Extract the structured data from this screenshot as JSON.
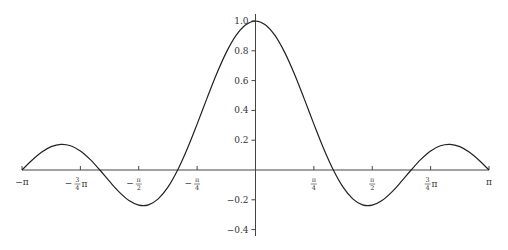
{
  "chart_data": {
    "type": "line",
    "title": "",
    "xlabel": "",
    "ylabel": "",
    "xlim": [
      -3.14159,
      3.14159
    ],
    "ylim": [
      -0.45,
      1.0
    ],
    "grid": false,
    "legend": null,
    "x_ticks": [
      {
        "value": -3.14159,
        "label": "−π",
        "num": "",
        "den": "",
        "suffix": ""
      },
      {
        "value": -2.35619,
        "label": "−¾π",
        "num": "3",
        "den": "4",
        "suffix": "π",
        "sign": "−"
      },
      {
        "value": -1.5708,
        "label": "−π/2",
        "num": "π",
        "den": "2",
        "suffix": "",
        "sign": "−"
      },
      {
        "value": -0.7854,
        "label": "−π/4",
        "num": "π",
        "den": "4",
        "suffix": "",
        "sign": "−"
      },
      {
        "value": 0.7854,
        "label": "π/4",
        "num": "π",
        "den": "4",
        "suffix": "",
        "sign": ""
      },
      {
        "value": 1.5708,
        "label": "π/2",
        "num": "π",
        "den": "2",
        "suffix": "",
        "sign": ""
      },
      {
        "value": 2.35619,
        "label": "¾π",
        "num": "3",
        "den": "4",
        "suffix": "π",
        "sign": ""
      },
      {
        "value": 3.14159,
        "label": "π",
        "num": "",
        "den": "",
        "suffix": ""
      }
    ],
    "y_ticks": [
      {
        "value": 1.0,
        "label": "1.0"
      },
      {
        "value": 0.8,
        "label": "0.8"
      },
      {
        "value": 0.6,
        "label": "0.6"
      },
      {
        "value": 0.4,
        "label": "0.4"
      },
      {
        "value": 0.2,
        "label": "0.2"
      },
      {
        "value": -0.2,
        "label": "-0.2"
      },
      {
        "value": -0.4,
        "label": "-0.4"
      }
    ],
    "series": [
      {
        "name": "f(x)",
        "color": "#222222",
        "x": [
          -3.1416,
          -3.0107,
          -2.8798,
          -2.7489,
          -2.618,
          -2.4871,
          -2.3562,
          -2.2253,
          -2.0944,
          -1.9635,
          -1.8326,
          -1.7017,
          -1.5708,
          -1.4399,
          -1.309,
          -1.1781,
          -1.0472,
          -0.9163,
          -0.7854,
          -0.6545,
          -0.5236,
          -0.3927,
          -0.2618,
          -0.1309,
          0,
          0.1309,
          0.2618,
          0.3927,
          0.5236,
          0.6545,
          0.7854,
          0.9163,
          1.0472,
          1.1781,
          1.309,
          1.4399,
          1.5708,
          1.7017,
          1.8326,
          1.9635,
          2.0944,
          2.2253,
          2.3562,
          2.4871,
          2.618,
          2.7489,
          2.8798,
          3.0107,
          3.1416
        ],
        "values": [
          0,
          0.0639,
          0.1189,
          0.157,
          0.1725,
          0.1626,
          0.1276,
          0.0711,
          0,
          -0.0767,
          -0.1485,
          -0.2048,
          -0.2357,
          -0.2336,
          -0.1936,
          -0.1148,
          0,
          0.1442,
          0.308,
          0.4791,
          0.644,
          0.7893,
          0.9031,
          0.9753,
          1.0,
          0.9753,
          0.9031,
          0.7893,
          0.644,
          0.4791,
          0.308,
          0.1442,
          0,
          -0.1148,
          -0.1936,
          -0.2336,
          -0.2357,
          -0.2048,
          -0.1485,
          -0.0767,
          0,
          0.0711,
          0.1276,
          0.1626,
          0.1725,
          0.157,
          0.1189,
          0.0639,
          0
        ]
      }
    ]
  }
}
